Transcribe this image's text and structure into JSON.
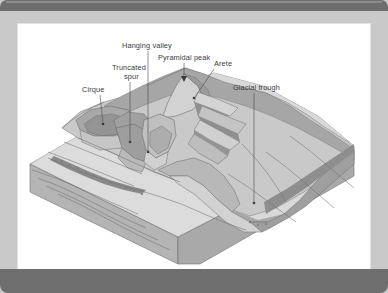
{
  "viewer": {
    "background_color": "#c9c9c9",
    "bar_color": "#6e6e6e",
    "canvas_color": "#ffffff"
  },
  "figure": {
    "type": "block-diagram",
    "palette": {
      "snow_lightest": "#e6e6e6",
      "plateau_light": "#d5d5d5",
      "slope_mid": "#c2c2c2",
      "slope_mid2": "#b4b4b4",
      "rock_dark": "#9a9a9a",
      "rock_darker": "#8b8b8b",
      "block_side": "#b0b0b0",
      "block_front": "#bcbcbc",
      "outline": "#6f6f6f",
      "label_text": "#3b3b3b",
      "leader_line": "#4a4a4a"
    },
    "labels": [
      {
        "id": "cirque",
        "text": "Cirque",
        "x": 64,
        "y": 68,
        "anchor": "start",
        "tip_x": 85,
        "tip_y": 100
      },
      {
        "id": "truncated-spur",
        "text": "Truncated",
        "x": 94,
        "y": 46,
        "anchor": "start",
        "tip_x": 112,
        "tip_y": 118
      },
      {
        "id": "truncated-spur-line2",
        "text": "spur",
        "x": 106,
        "y": 55,
        "anchor": "start",
        "tip_x": 112,
        "tip_y": 118
      },
      {
        "id": "hanging-valley",
        "text": "Hanging valley",
        "x": 104,
        "y": 24,
        "anchor": "start",
        "tip_x": 130,
        "tip_y": 128
      },
      {
        "id": "pyramidal-peak",
        "text": "Pyramidal peak",
        "x": 140,
        "y": 36,
        "anchor": "start",
        "tip_x": 166,
        "tip_y": 57
      },
      {
        "id": "arete",
        "text": "Arete",
        "x": 196,
        "y": 42,
        "anchor": "start",
        "tip_x": 176,
        "tip_y": 74
      },
      {
        "id": "glacial-trough",
        "text": "Glacial trough",
        "x": 215,
        "y": 66,
        "anchor": "start",
        "tip_x": 236,
        "tip_y": 179
      }
    ],
    "landforms": [
      "Cirque",
      "Truncated spur",
      "Hanging valley",
      "Pyramidal peak",
      "Arete",
      "Glacial trough"
    ]
  }
}
